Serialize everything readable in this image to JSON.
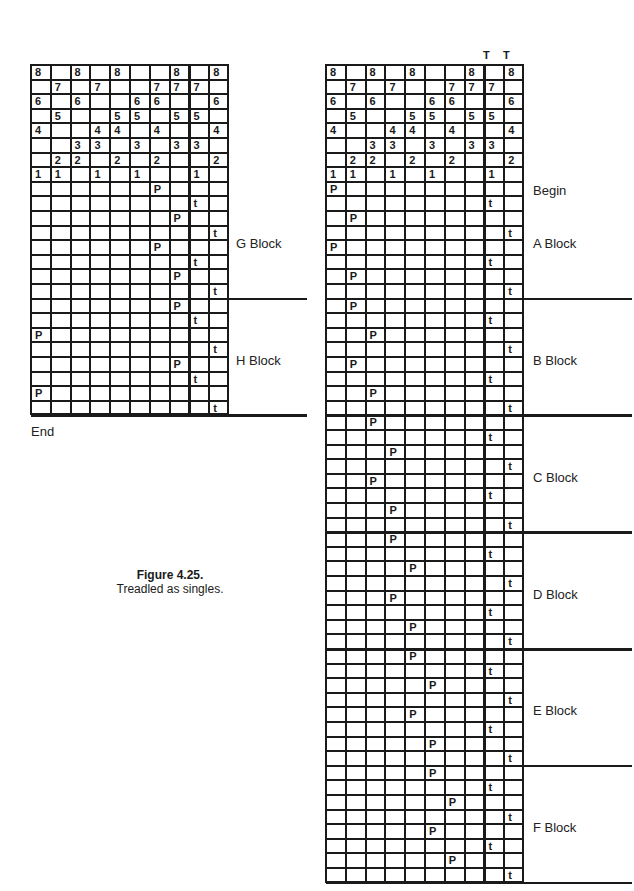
{
  "figure": {
    "title": "Figure 4.25.",
    "subtitle": "Treadled as singles."
  },
  "threading": [
    [
      "8",
      "",
      "8",
      "",
      "8",
      "",
      "",
      "8",
      "",
      "8"
    ],
    [
      "",
      "7",
      "",
      "7",
      "",
      "",
      "7",
      "7",
      "7",
      ""
    ],
    [
      "6",
      "",
      "6",
      "",
      "",
      "6",
      "6",
      "",
      "",
      "6"
    ],
    [
      "",
      "5",
      "",
      "",
      "5",
      "5",
      "",
      "5",
      "5",
      ""
    ],
    [
      "4",
      "",
      "",
      "4",
      "4",
      "",
      "4",
      "",
      "",
      "4"
    ],
    [
      "",
      "",
      "3",
      "3",
      "",
      "3",
      "",
      "3",
      "3",
      ""
    ],
    [
      "",
      "2",
      "2",
      "",
      "2",
      "",
      "2",
      "",
      "",
      "2"
    ],
    [
      "1",
      "1",
      "",
      "1",
      "",
      "1",
      "",
      "",
      "1",
      ""
    ]
  ],
  "left_grid": {
    "end_label": "End",
    "blocks": [
      {
        "label": "G Block",
        "rows": [
          [
            6,
            "P"
          ],
          [
            8,
            "t"
          ],
          [
            7,
            "P"
          ],
          [
            9,
            "t"
          ],
          [
            6,
            "P"
          ],
          [
            8,
            "t"
          ],
          [
            7,
            "P"
          ],
          [
            9,
            "t"
          ]
        ]
      },
      {
        "label": "H Block",
        "rows": [
          [
            7,
            "P"
          ],
          [
            8,
            "t"
          ],
          [
            0,
            "P"
          ],
          [
            9,
            "t"
          ],
          [
            7,
            "P"
          ],
          [
            8,
            "t"
          ],
          [
            0,
            "P"
          ],
          [
            9,
            "t"
          ]
        ]
      }
    ]
  },
  "right_grid": {
    "tie_marks": [
      "T",
      "T"
    ],
    "begin_label": "Begin",
    "blocks": [
      {
        "label": "A Block",
        "rows": [
          [
            0,
            "P"
          ],
          [
            8,
            "t"
          ],
          [
            1,
            "P"
          ],
          [
            9,
            "t"
          ],
          [
            0,
            "P"
          ],
          [
            8,
            "t"
          ],
          [
            1,
            "P"
          ],
          [
            9,
            "t"
          ]
        ]
      },
      {
        "label": "B Block",
        "rows": [
          [
            1,
            "P"
          ],
          [
            8,
            "t"
          ],
          [
            2,
            "P"
          ],
          [
            9,
            "t"
          ],
          [
            1,
            "P"
          ],
          [
            8,
            "t"
          ],
          [
            2,
            "P"
          ],
          [
            9,
            "t"
          ]
        ]
      },
      {
        "label": "C Block",
        "rows": [
          [
            2,
            "P"
          ],
          [
            8,
            "t"
          ],
          [
            3,
            "P"
          ],
          [
            9,
            "t"
          ],
          [
            2,
            "P"
          ],
          [
            8,
            "t"
          ],
          [
            3,
            "P"
          ],
          [
            9,
            "t"
          ]
        ]
      },
      {
        "label": "D Block",
        "rows": [
          [
            3,
            "P"
          ],
          [
            8,
            "t"
          ],
          [
            4,
            "P"
          ],
          [
            9,
            "t"
          ],
          [
            3,
            "P"
          ],
          [
            8,
            "t"
          ],
          [
            4,
            "P"
          ],
          [
            9,
            "t"
          ]
        ]
      },
      {
        "label": "E Block",
        "rows": [
          [
            4,
            "P"
          ],
          [
            8,
            "t"
          ],
          [
            5,
            "P"
          ],
          [
            9,
            "t"
          ],
          [
            4,
            "P"
          ],
          [
            8,
            "t"
          ],
          [
            5,
            "P"
          ],
          [
            9,
            "t"
          ]
        ]
      },
      {
        "label": "F Block",
        "rows": [
          [
            5,
            "P"
          ],
          [
            8,
            "t"
          ],
          [
            6,
            "P"
          ],
          [
            9,
            "t"
          ],
          [
            5,
            "P"
          ],
          [
            8,
            "t"
          ],
          [
            6,
            "P"
          ],
          [
            9,
            "t"
          ]
        ]
      }
    ]
  },
  "colors": {
    "ink": "#1a1a1a",
    "background": "#ffffff"
  }
}
